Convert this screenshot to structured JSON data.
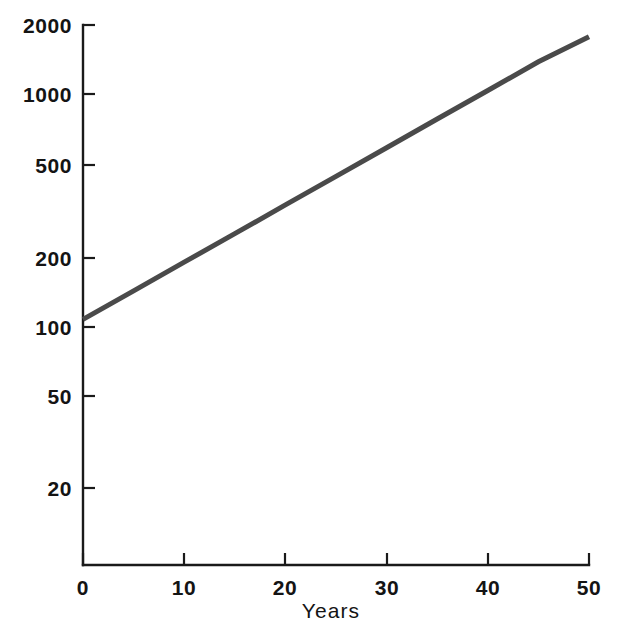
{
  "chart_data": {
    "type": "line",
    "title": "",
    "subtitle": "",
    "xlabel": "Years",
    "ylabel": "",
    "yscale": "log",
    "xscale": "linear",
    "grid": false,
    "legend": false,
    "legend_position": "none",
    "xlim": [
      0,
      50
    ],
    "ylim": [
      13,
      2000
    ],
    "xticks": [
      0,
      10,
      20,
      30,
      40,
      50
    ],
    "xticklabels": [
      "0",
      "10",
      "20",
      "30",
      "40",
      "50"
    ],
    "yticks": [
      20,
      50,
      100,
      200,
      500,
      1000,
      2000
    ],
    "yticklabels": [
      "20",
      "50",
      "100",
      "200",
      "500",
      "1000",
      "2000"
    ],
    "annotations": [],
    "series": [
      {
        "name": "growth",
        "color": "#4a4a4a",
        "x": [
          0,
          5,
          10,
          15,
          20,
          25,
          30,
          35,
          40,
          45,
          50
        ],
        "values": [
          107,
          142,
          189,
          251,
          334,
          444,
          590,
          785,
          1043,
          1387,
          1780
        ]
      }
    ]
  },
  "axes": {
    "x_title": "Years",
    "y_ticks": [
      {
        "label": "2000",
        "value": 2000
      },
      {
        "label": "1000",
        "value": 1000
      },
      {
        "label": "500",
        "value": 500
      },
      {
        "label": "200",
        "value": 200
      },
      {
        "label": "100",
        "value": 100
      },
      {
        "label": "50",
        "value": 50
      },
      {
        "label": "20",
        "value": 20
      }
    ],
    "x_ticks": [
      {
        "label": "0",
        "value": 0
      },
      {
        "label": "10",
        "value": 10
      },
      {
        "label": "20",
        "value": 20
      },
      {
        "label": "30",
        "value": 30
      },
      {
        "label": "40",
        "value": 40
      },
      {
        "label": "50",
        "value": 50
      }
    ]
  },
  "colors": {
    "background": "#ffffff",
    "axis": "#1a1a1a",
    "text": "#141414",
    "series": "#4a4a4a"
  }
}
